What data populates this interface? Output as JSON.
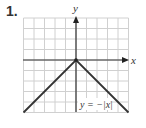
{
  "problem_number": "1.",
  "chart_data": {
    "type": "line",
    "title": "",
    "function_label": "y = −|x|",
    "xlabel": "x",
    "ylabel": "y",
    "xlim": [
      -5,
      5
    ],
    "ylim": [
      -5,
      4
    ],
    "grid": true,
    "series": [
      {
        "name": "y = −|x|",
        "x": [
          -5,
          0,
          5
        ],
        "y": [
          -5,
          0,
          -5
        ]
      }
    ]
  },
  "colors": {
    "grid": "#d0d0d0",
    "axis": "#333333",
    "curve": "#333333",
    "text": "#333333"
  }
}
